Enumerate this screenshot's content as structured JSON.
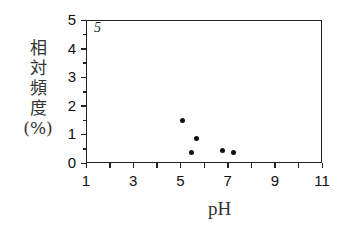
{
  "chart_data": {
    "type": "scatter",
    "title": "",
    "panel_label": "5",
    "xlabel": "pH",
    "ylabel": "相対頻度(%)",
    "ylabel_lines": [
      "相",
      "対",
      "頻",
      "度",
      "(%)"
    ],
    "xlim": [
      1,
      11
    ],
    "ylim": [
      0,
      5
    ],
    "xticks": [
      1,
      3,
      5,
      7,
      9,
      11
    ],
    "yticks": [
      0,
      1,
      2,
      3,
      4,
      5
    ],
    "grid": false,
    "legend": null,
    "points": [
      {
        "x": 5.1,
        "y": 1.5
      },
      {
        "x": 5.7,
        "y": 0.85
      },
      {
        "x": 5.45,
        "y": 0.35
      },
      {
        "x": 6.8,
        "y": 0.45
      },
      {
        "x": 7.25,
        "y": 0.35
      }
    ]
  }
}
